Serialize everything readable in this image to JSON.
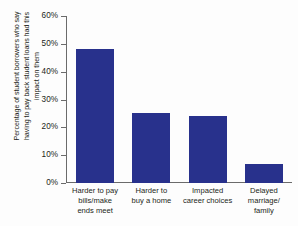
{
  "chart_data": {
    "type": "bar",
    "title": "",
    "subtitle": "",
    "xlabel": "",
    "ylabel": "Percentage of student borrowers who say having to pay back student loans had this impact on them",
    "categories": [
      "Harder to pay bills/make ends meet",
      "Harder to buy a home",
      "Impacted career choices",
      "Delayed marriage/family"
    ],
    "values": [
      48,
      25,
      24,
      7
    ],
    "ylim": [
      0,
      60
    ],
    "ytick_labels": [
      "60%",
      "50%",
      "40%",
      "30%",
      "20%",
      "10%",
      "0%"
    ],
    "ytick_values": [
      60,
      50,
      40,
      30,
      20,
      10,
      0
    ],
    "grid": false,
    "legend": false,
    "bar_color": "#28318c",
    "axis_color": "#6b6b6b",
    "background_color": "#fdfdfd"
  },
  "axis": {
    "y_title_lines": [
      "Percentage of student borrowers who say",
      "having to pay back student loans had this",
      "impact on them"
    ]
  },
  "categories_wrapped": [
    [
      "Harder to pay",
      "bills/make",
      "ends meet"
    ],
    [
      "Harder to",
      "buy a home"
    ],
    [
      "Impacted",
      "career choices"
    ],
    [
      "Delayed",
      "marriage/",
      "family"
    ]
  ]
}
